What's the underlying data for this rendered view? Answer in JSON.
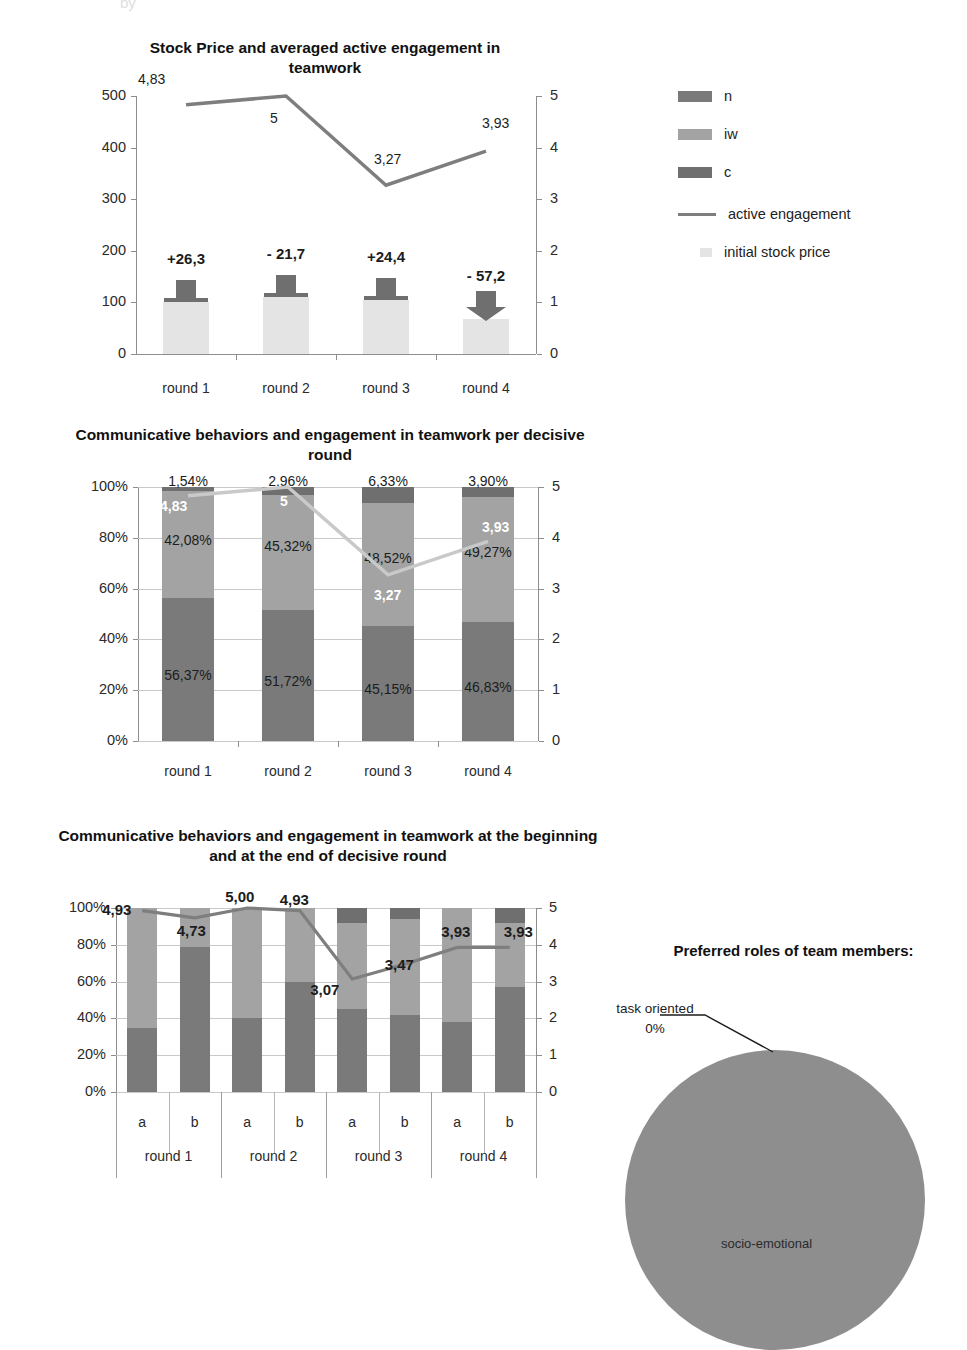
{
  "page": {
    "top_cut_text": "by"
  },
  "legend": {
    "items": [
      {
        "label": "n",
        "type": "swatch",
        "color": "#7a7a7a"
      },
      {
        "label": "iw",
        "type": "swatch",
        "color": "#a3a3a3"
      },
      {
        "label": "c",
        "type": "swatch",
        "color": "#6f6f6f"
      },
      {
        "label": "active engagement",
        "type": "line",
        "color": "#7e7e7e"
      },
      {
        "label": "initial stock price",
        "type": "swatch-small",
        "color": "#e4e4e4"
      }
    ]
  },
  "chart_data": [
    {
      "id": "stock-price-engagement",
      "type": "bar",
      "title": "Stock Price and  averaged active engagement in teamwork",
      "categories": [
        "round 1",
        "round 2",
        "round 3",
        "round 4"
      ],
      "ylabel": "",
      "xlabel": "",
      "ylim": [
        0,
        500
      ],
      "yticks": [
        "0",
        "100",
        "200",
        "300",
        "400",
        "500"
      ],
      "y2lim": [
        0,
        5
      ],
      "y2ticks": [
        "0",
        "1",
        "2",
        "3",
        "4",
        "5"
      ],
      "grid": false,
      "series": [
        {
          "name": "initial stock price",
          "color": "#e4e4e4",
          "axis": "left",
          "values": [
            100,
            110,
            105,
            68
          ]
        },
        {
          "name": "change",
          "color": "#6f6f6f",
          "axis": "left",
          "labels": [
            "+26,3",
            "- 21,7",
            "+24,4",
            "- 57,2"
          ],
          "directions": [
            "up",
            "up",
            "up",
            "down"
          ]
        },
        {
          "name": "active engagement",
          "color": "#7e7e7e",
          "axis": "right",
          "values": [
            4.83,
            5,
            3.27,
            3.93
          ],
          "labels": [
            "4,83",
            "5",
            "3,27",
            "3,93"
          ]
        }
      ]
    },
    {
      "id": "comm-behaviors-per-round",
      "type": "bar",
      "title": "Communicative behaviors and engagement in teamwork per decisive round",
      "categories": [
        "round 1",
        "round 2",
        "round 3",
        "round 4"
      ],
      "ylim": [
        0,
        100
      ],
      "yticks": [
        "0%",
        "20%",
        "40%",
        "60%",
        "80%",
        "100%"
      ],
      "y2lim": [
        0,
        5
      ],
      "y2ticks": [
        "0",
        "1",
        "2",
        "3",
        "4",
        "5"
      ],
      "grid": true,
      "stacked": true,
      "series": [
        {
          "name": "n",
          "color": "#7a7a7a",
          "values": [
            56.37,
            51.72,
            45.15,
            46.83
          ],
          "labels": [
            "56,37%",
            "51,72%",
            "45,15%",
            "46,83%"
          ],
          "label_color": "dark"
        },
        {
          "name": "iw",
          "color": "#a3a3a3",
          "values": [
            42.08,
            45.32,
            48.52,
            49.27
          ],
          "labels": [
            "42,08%",
            "45,32%",
            "48,52%",
            "49,27%"
          ],
          "label_color": "dark"
        },
        {
          "name": "c",
          "color": "#6f6f6f",
          "values": [
            1.54,
            2.96,
            6.33,
            3.9
          ],
          "labels": [
            "1,54%",
            "2,96%",
            "6,33%",
            "3,90%"
          ],
          "label_color": "dark"
        },
        {
          "name": "active engagement",
          "color": "#c9c9c9",
          "axis": "right",
          "values": [
            4.83,
            5,
            3.27,
            3.93
          ],
          "labels": [
            "4,83",
            "5",
            "3,27",
            "3,93"
          ],
          "label_color": "white"
        }
      ]
    },
    {
      "id": "comm-behaviors-begin-end",
      "type": "bar",
      "title": "Communicative behaviors and engagement in teamwork at the beginning and at  the end of decisive round",
      "categories": [
        "a",
        "b",
        "a",
        "b",
        "a",
        "b",
        "a",
        "b"
      ],
      "groups": [
        "round 1",
        "round 2",
        "round 3",
        "round 4"
      ],
      "ylim": [
        0,
        100
      ],
      "yticks": [
        "0%",
        "20%",
        "40%",
        "60%",
        "80%",
        "100%"
      ],
      "y2lim": [
        0,
        5
      ],
      "y2ticks": [
        "0",
        "1",
        "2",
        "3",
        "4",
        "5"
      ],
      "grid": true,
      "stacked": true,
      "series": [
        {
          "name": "n",
          "color": "#7a7a7a",
          "values": [
            35,
            79,
            40,
            60,
            45,
            42,
            38,
            57
          ]
        },
        {
          "name": "iw",
          "color": "#a3a3a3",
          "values": [
            65,
            21,
            60,
            40,
            47,
            52,
            62,
            35
          ]
        },
        {
          "name": "c",
          "color": "#6f6f6f",
          "values": [
            0,
            0,
            0,
            0,
            8,
            6,
            0,
            8
          ]
        },
        {
          "name": "active engagement",
          "color": "#7e7e7e",
          "axis": "right",
          "values": [
            4.93,
            4.73,
            5.0,
            4.93,
            3.07,
            3.47,
            3.93,
            3.93
          ],
          "labels": [
            "4,93",
            "4,73",
            "5,00",
            "4,93",
            "3,07",
            "3,47",
            "3,93",
            "3,93"
          ]
        }
      ]
    },
    {
      "id": "preferred-roles",
      "type": "pie",
      "title": "Preferred roles of team members:",
      "labels": [
        "task oriented",
        "socio-emotional"
      ],
      "values": [
        0,
        100
      ],
      "value_labels": [
        "0%",
        ""
      ],
      "colors": [
        "#888888",
        "#8e8e8e"
      ],
      "annotations": [
        {
          "text": "task oriented",
          "sub": "0%"
        },
        {
          "text": "socio-emotional"
        }
      ]
    }
  ]
}
